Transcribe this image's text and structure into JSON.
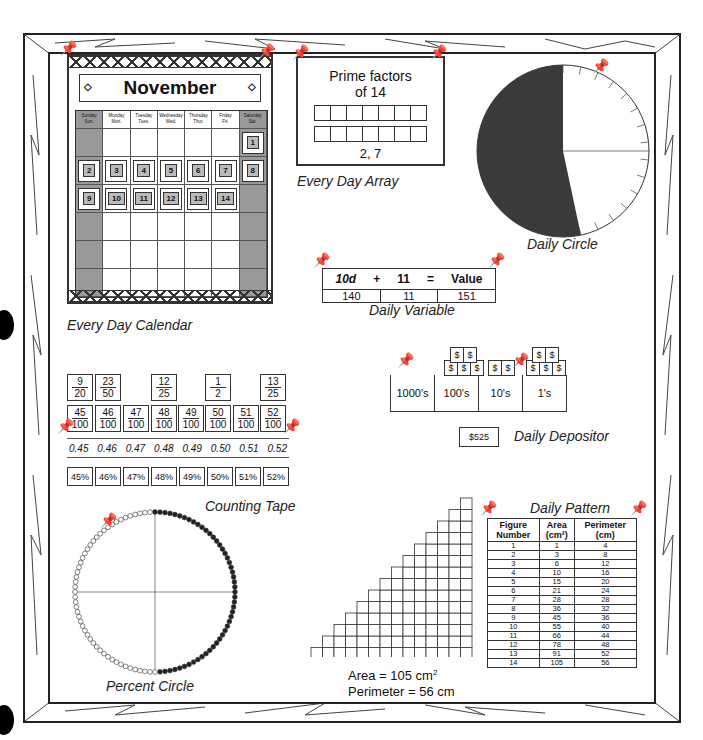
{
  "calendar": {
    "month": "November",
    "caption": "Every Day Calendar",
    "day_headers": [
      {
        "full": "Sunday",
        "abbr": "Sun."
      },
      {
        "full": "Monday",
        "abbr": "Mon."
      },
      {
        "full": "Tuesday",
        "abbr": "Tues."
      },
      {
        "full": "Wednesday",
        "abbr": "Wed."
      },
      {
        "full": "Thursday",
        "abbr": "Thur."
      },
      {
        "full": "Friday",
        "abbr": "Fri."
      },
      {
        "full": "Saturday",
        "abbr": "Sat."
      }
    ],
    "days": [
      "1",
      "2",
      "3",
      "4",
      "5",
      "6",
      "7",
      "8",
      "9",
      "10",
      "11",
      "12",
      "13",
      "14"
    ]
  },
  "array": {
    "title_line1": "Prime factors",
    "title_line2": "of 14",
    "answer": "2, 7",
    "caption": "Every Day Array"
  },
  "daily_circle": {
    "caption": "Daily Circle",
    "days_elapsed": 14,
    "total_days": 30,
    "shaded_color": "#3a3a3a"
  },
  "variable": {
    "headers": [
      "10d",
      "+",
      "11",
      "=",
      "Value"
    ],
    "values": [
      "140",
      "11",
      "151"
    ],
    "caption": "Daily Variable"
  },
  "depositor": {
    "place_values": [
      "1000's",
      "100's",
      "10's",
      "1's"
    ],
    "bill_symbol": "$",
    "total": "$525",
    "caption": "Daily Depositor"
  },
  "counting_tape": {
    "top_fractions": [
      {
        "n": "9",
        "d": "20"
      },
      {
        "n": "23",
        "d": "50"
      },
      {
        "n": "12",
        "d": "25"
      },
      {
        "n": "1",
        "d": "2"
      },
      {
        "n": "13",
        "d": "25"
      }
    ],
    "hundredths": [
      {
        "n": "45",
        "d": "100"
      },
      {
        "n": "46",
        "d": "100"
      },
      {
        "n": "47",
        "d": "100"
      },
      {
        "n": "48",
        "d": "100"
      },
      {
        "n": "49",
        "d": "100"
      },
      {
        "n": "50",
        "d": "100"
      },
      {
        "n": "51",
        "d": "100"
      },
      {
        "n": "52",
        "d": "100"
      }
    ],
    "decimals": [
      "0.45",
      "0.46",
      "0.47",
      "0.48",
      "0.49",
      "0.50",
      "0.51",
      "0.52"
    ],
    "percents": [
      "45%",
      "46%",
      "47%",
      "48%",
      "49%",
      "50%",
      "51%",
      "52%"
    ],
    "caption": "Counting Tape"
  },
  "percent_circle": {
    "caption": "Percent Circle",
    "beads_total": 100,
    "beads_filled": 50
  },
  "staircase": {
    "rows": 14,
    "area_label": "Area = 105 cm",
    "area_sup": "2",
    "perimeter_label": "Perimeter = 56 cm"
  },
  "pattern": {
    "caption": "Daily Pattern",
    "headers": [
      {
        "line1": "Figure",
        "line2": "Number"
      },
      {
        "line1": "Area",
        "line2": "(cm²)"
      },
      {
        "line1": "Perimeter",
        "line2": "(cm)"
      }
    ],
    "rows": [
      [
        "1",
        "1",
        "4"
      ],
      [
        "2",
        "3",
        "8"
      ],
      [
        "3",
        "6",
        "12"
      ],
      [
        "4",
        "10",
        "16"
      ],
      [
        "5",
        "15",
        "20"
      ],
      [
        "6",
        "21",
        "24"
      ],
      [
        "7",
        "28",
        "28"
      ],
      [
        "8",
        "36",
        "32"
      ],
      [
        "9",
        "45",
        "36"
      ],
      [
        "10",
        "55",
        "40"
      ],
      [
        "11",
        "66",
        "44"
      ],
      [
        "12",
        "78",
        "48"
      ],
      [
        "13",
        "91",
        "52"
      ],
      [
        "14",
        "105",
        "56"
      ]
    ]
  }
}
